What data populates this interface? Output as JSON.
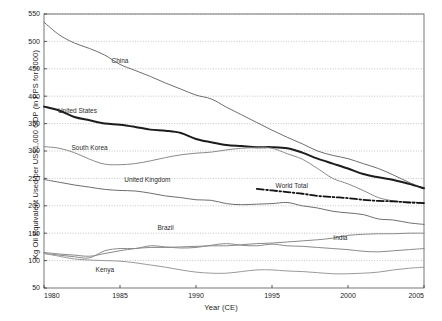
{
  "chart_data": {
    "type": "line",
    "title": "",
    "xlabel": "Year (CE)",
    "ylabel": "Kg Oil Equivalent Used per US$1,000 GDP (in PPS for 2000)",
    "xlim": [
      1980,
      2005
    ],
    "ylim": [
      50,
      550
    ],
    "xticks": [
      "1980",
      "1985",
      "1990",
      "1995",
      "2000",
      "2005"
    ],
    "xtick_values": [
      1980,
      1985,
      1990,
      1995,
      2000,
      2005
    ],
    "yticks": [
      "50",
      "100",
      "150",
      "200",
      "250",
      "300",
      "350",
      "400",
      "450",
      "500",
      "550"
    ],
    "ytick_values": [
      50,
      100,
      150,
      200,
      250,
      300,
      350,
      400,
      450,
      500,
      550
    ],
    "grid": true,
    "grid_style": "dotted",
    "legend": "inline-labels",
    "x": [
      1980,
      1981,
      1982,
      1983,
      1984,
      1985,
      1986,
      1987,
      1988,
      1989,
      1990,
      1991,
      1992,
      1993,
      1994,
      1995,
      1996,
      1997,
      1998,
      1999,
      2000,
      2001,
      2002,
      2003,
      2004,
      2005
    ],
    "series": [
      {
        "name": "China",
        "color": "#6e6e6e",
        "width": 1.0,
        "dash": "none",
        "label_x": 1985.0,
        "label_y": 461,
        "values": [
          535,
          512,
          497,
          487,
          475,
          458,
          447,
          436,
          424,
          413,
          402,
          395,
          380,
          366,
          352,
          338,
          325,
          313,
          300,
          292,
          286,
          277,
          268,
          256,
          243,
          232
        ]
      },
      {
        "name": "United States",
        "color": "#1c1c1c",
        "width": 2.0,
        "dash": "none",
        "label_x": 1982.2,
        "label_y": 370,
        "values": [
          381,
          374,
          362,
          356,
          350,
          348,
          344,
          339,
          337,
          333,
          322,
          316,
          311,
          309,
          307,
          307,
          305,
          297,
          286,
          277,
          268,
          258,
          252,
          247,
          240,
          232
        ]
      },
      {
        "name": "South Korea",
        "color": "#8a8a8a",
        "width": 1.0,
        "dash": "none",
        "label_x": 1983.0,
        "label_y": 302,
        "values": [
          308,
          305,
          297,
          285,
          276,
          275,
          277,
          282,
          288,
          293,
          296,
          298,
          302,
          305,
          306,
          305,
          295,
          285,
          268,
          250,
          240,
          228,
          215,
          209,
          207,
          206
        ]
      },
      {
        "name": "United Kingdom",
        "color": "#6e6e6e",
        "width": 1.0,
        "dash": "none",
        "label_x": 1986.8,
        "label_y": 243,
        "values": [
          248,
          243,
          238,
          234,
          230,
          228,
          227,
          223,
          218,
          215,
          211,
          210,
          204,
          202,
          203,
          204,
          206,
          200,
          196,
          190,
          187,
          184,
          176,
          174,
          169,
          166
        ]
      },
      {
        "name": "World Total",
        "color": "#111111",
        "width": 1.8,
        "dash": "dashdot",
        "label_x": 1996.3,
        "label_y": 232,
        "start_year": 1994,
        "values": [
          null,
          null,
          null,
          null,
          null,
          null,
          null,
          null,
          null,
          null,
          null,
          null,
          null,
          null,
          231,
          228,
          225,
          222,
          218,
          216,
          214,
          211,
          209,
          208,
          206,
          205
        ]
      },
      {
        "name": "Brazil",
        "color": "#8a8a8a",
        "width": 1.0,
        "dash": "none",
        "label_x": 1988.0,
        "label_y": 155,
        "values": [
          115,
          112,
          110,
          108,
          113,
          118,
          122,
          124,
          124,
          125,
          126,
          127,
          127,
          129,
          131,
          132,
          134,
          136,
          138,
          141,
          146,
          148,
          149,
          149,
          150,
          150
        ]
      },
      {
        "name": "India",
        "color": "#8a8a8a",
        "width": 1.0,
        "dash": "none",
        "label_x": 1999.5,
        "label_y": 137,
        "values": [
          113,
          110,
          107,
          105,
          118,
          122,
          122,
          127,
          125,
          123,
          124,
          128,
          131,
          128,
          127,
          130,
          127,
          126,
          124,
          122,
          120,
          117,
          116,
          118,
          120,
          122
        ]
      },
      {
        "name": "Kenya",
        "color": "#9a9a9a",
        "width": 1.0,
        "dash": "none",
        "label_x": 1984.0,
        "label_y": 80,
        "values": [
          113,
          108,
          103,
          101,
          100,
          99,
          96,
          92,
          88,
          83,
          79,
          77,
          77,
          80,
          83,
          83,
          81,
          80,
          78,
          76,
          76,
          77,
          79,
          83,
          86,
          88
        ]
      }
    ]
  },
  "axes": {
    "x_title": "Year (CE)",
    "y_title": "Kg Oil Equivalent Used per US$1,000 GDP (in PPS for 2000)"
  }
}
